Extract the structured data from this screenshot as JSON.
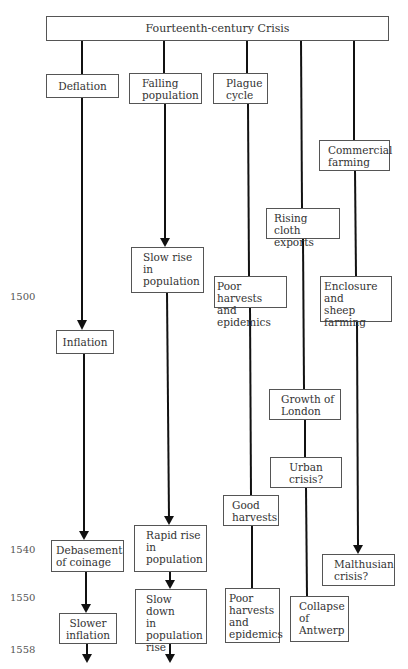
{
  "diagram": {
    "title": "Fourteenth-century Crisis",
    "years": [
      {
        "label": "1500",
        "y": 291
      },
      {
        "label": "1540",
        "y": 544
      },
      {
        "label": "1550",
        "y": 592
      },
      {
        "label": "1558",
        "y": 644
      }
    ],
    "columns": [
      {
        "name": "money",
        "nodes": [
          {
            "id": "deflation",
            "label": "Deflation"
          },
          {
            "id": "inflation",
            "label": "Inflation"
          },
          {
            "id": "debasement",
            "label": "Debasement\nof coinage"
          },
          {
            "id": "slower-inflation",
            "label": "Slower\ninflation"
          }
        ]
      },
      {
        "name": "population",
        "nodes": [
          {
            "id": "falling-population",
            "label": "Falling\npopulation"
          },
          {
            "id": "slow-rise",
            "label": "Slow rise\nin\npopulation"
          },
          {
            "id": "rapid-rise",
            "label": "Rapid rise\nin\npopulation"
          },
          {
            "id": "slow-down",
            "label": "Slow down\nin\npopulation\nrise"
          }
        ]
      },
      {
        "name": "harvests",
        "nodes": [
          {
            "id": "plague-cycle",
            "label": "Plague\ncycle"
          },
          {
            "id": "poor-harvests-1",
            "label": "Poor harvests\nand epidemics"
          },
          {
            "id": "good-harvests",
            "label": "Good\nharvests"
          },
          {
            "id": "poor-harvests-2",
            "label": "Poor\nharvests\nand\nepidemics"
          }
        ]
      },
      {
        "name": "trade",
        "nodes": [
          {
            "id": "rising-cloth",
            "label": "Rising\ncloth exports"
          },
          {
            "id": "growth-london",
            "label": "Growth of\nLondon"
          },
          {
            "id": "urban-crisis",
            "label": "Urban\ncrisis?"
          },
          {
            "id": "collapse-antwerp",
            "label": "Collapse\nof\nAntwerp"
          }
        ]
      },
      {
        "name": "agriculture",
        "nodes": [
          {
            "id": "commercial-farming",
            "label": "Commercial\nfarming"
          },
          {
            "id": "enclosure",
            "label": "Enclosure\nand\nsheep farming"
          },
          {
            "id": "malthusian-crisis",
            "label": "Malthusian\ncrisis?"
          }
        ]
      }
    ]
  }
}
